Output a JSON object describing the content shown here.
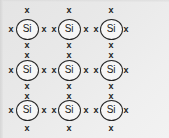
{
  "figure": {
    "name": "silicon-covalent-bond-lattice",
    "background_color": "#e8e8e8",
    "atom_label": "Si",
    "electron_symbol": "x",
    "atom_outline_color": "#262626",
    "electron_color": "#1d1d1d",
    "grid": {
      "rows": 3,
      "columns": 3
    },
    "atom_spacing_px": {
      "x": 42,
      "y": 40
    },
    "atoms": [
      {
        "id": "si-r1-c1",
        "cx": 27,
        "cy": 29,
        "label": "Si"
      },
      {
        "id": "si-r1-c2",
        "cx": 69,
        "cy": 29,
        "label": "Si"
      },
      {
        "id": "si-r1-c3",
        "cx": 111,
        "cy": 29,
        "label": "Si"
      },
      {
        "id": "si-r2-c1",
        "cx": 27,
        "cy": 70,
        "label": "Si"
      },
      {
        "id": "si-r2-c2",
        "cx": 69,
        "cy": 70,
        "label": "Si"
      },
      {
        "id": "si-r2-c3",
        "cx": 111,
        "cy": 70,
        "label": "Si"
      },
      {
        "id": "si-r3-c1",
        "cx": 27,
        "cy": 110,
        "label": "Si"
      },
      {
        "id": "si-r3-c2",
        "cx": 69,
        "cy": 110,
        "label": "Si"
      },
      {
        "id": "si-r3-c3",
        "cx": 111,
        "cy": 110,
        "label": "Si"
      }
    ],
    "electrons": [
      {
        "id": "e-top-c1",
        "cx": 27,
        "cy": 10,
        "symbol": "x"
      },
      {
        "id": "e-top-c2",
        "cx": 69,
        "cy": 10,
        "symbol": "x"
      },
      {
        "id": "e-top-c3",
        "cx": 111,
        "cy": 10,
        "symbol": "x"
      },
      {
        "id": "e-r1-left",
        "cx": 11,
        "cy": 29,
        "symbol": "x"
      },
      {
        "id": "e-r1-c1c2-a",
        "cx": 44,
        "cy": 29,
        "symbol": "x"
      },
      {
        "id": "e-r1-c1c2-b",
        "cx": 54,
        "cy": 29,
        "symbol": "x"
      },
      {
        "id": "e-r1-c2c3-a",
        "cx": 86,
        "cy": 29,
        "symbol": "x"
      },
      {
        "id": "e-r1-c2c3-b",
        "cx": 96,
        "cy": 29,
        "symbol": "x"
      },
      {
        "id": "e-r1-right",
        "cx": 126,
        "cy": 29,
        "symbol": "x"
      },
      {
        "id": "e-c1-r1r2-a",
        "cx": 27,
        "cy": 45,
        "symbol": "x"
      },
      {
        "id": "e-c1-r1r2-b",
        "cx": 27,
        "cy": 55,
        "symbol": "x"
      },
      {
        "id": "e-c2-r1r2-a",
        "cx": 69,
        "cy": 45,
        "symbol": "x"
      },
      {
        "id": "e-c2-r1r2-b",
        "cx": 69,
        "cy": 55,
        "symbol": "x"
      },
      {
        "id": "e-c3-r1r2-a",
        "cx": 111,
        "cy": 45,
        "symbol": "x"
      },
      {
        "id": "e-c3-r1r2-b",
        "cx": 111,
        "cy": 55,
        "symbol": "x"
      },
      {
        "id": "e-r2-left",
        "cx": 11,
        "cy": 70,
        "symbol": "x"
      },
      {
        "id": "e-r2-c1c2-a",
        "cx": 44,
        "cy": 70,
        "symbol": "x"
      },
      {
        "id": "e-r2-c1c2-b",
        "cx": 54,
        "cy": 70,
        "symbol": "x"
      },
      {
        "id": "e-r2-c2c3-a",
        "cx": 86,
        "cy": 70,
        "symbol": "x"
      },
      {
        "id": "e-r2-c2c3-b",
        "cx": 96,
        "cy": 70,
        "symbol": "x"
      },
      {
        "id": "e-r2-right",
        "cx": 126,
        "cy": 70,
        "symbol": "x"
      },
      {
        "id": "e-c1-r2r3-a",
        "cx": 27,
        "cy": 86,
        "symbol": "x"
      },
      {
        "id": "e-c1-r2r3-b",
        "cx": 27,
        "cy": 96,
        "symbol": "x"
      },
      {
        "id": "e-c2-r2r3-a",
        "cx": 69,
        "cy": 86,
        "symbol": "x"
      },
      {
        "id": "e-c2-r2r3-b",
        "cx": 69,
        "cy": 96,
        "symbol": "x"
      },
      {
        "id": "e-c3-r2r3-a",
        "cx": 111,
        "cy": 86,
        "symbol": "x"
      },
      {
        "id": "e-c3-r2r3-b",
        "cx": 111,
        "cy": 96,
        "symbol": "x"
      },
      {
        "id": "e-r3-left",
        "cx": 11,
        "cy": 110,
        "symbol": "x"
      },
      {
        "id": "e-r3-c1c2-a",
        "cx": 44,
        "cy": 110,
        "symbol": "x"
      },
      {
        "id": "e-r3-c1c2-b",
        "cx": 54,
        "cy": 110,
        "symbol": "x"
      },
      {
        "id": "e-r3-c2c3-a",
        "cx": 86,
        "cy": 110,
        "symbol": "x"
      },
      {
        "id": "e-r3-c2c3-b",
        "cx": 96,
        "cy": 110,
        "symbol": "x"
      },
      {
        "id": "e-r3-right",
        "cx": 126,
        "cy": 110,
        "symbol": "x"
      },
      {
        "id": "e-bottom-c1",
        "cx": 27,
        "cy": 128,
        "symbol": "x"
      },
      {
        "id": "e-bottom-c2",
        "cx": 69,
        "cy": 128,
        "symbol": "x"
      },
      {
        "id": "e-bottom-c3",
        "cx": 111,
        "cy": 128,
        "symbol": "x"
      }
    ]
  }
}
